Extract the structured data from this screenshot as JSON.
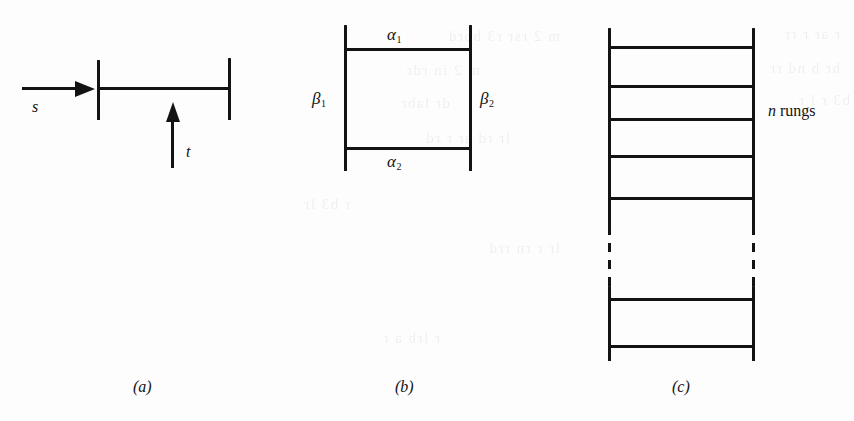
{
  "figure": {
    "background_color": "#fdfdfd",
    "ink_color": "#131313",
    "width": 854,
    "height": 421,
    "panels": [
      {
        "id": "a",
        "caption": "(a)",
        "description": "two vertical bars joined by a horizontal bar, with an incoming horizontal arrow labelled s and an upward arrow labelled t",
        "labels": [
          {
            "name": "s",
            "text": "s",
            "style": "italic"
          },
          {
            "name": "t",
            "text": "t",
            "style": "italic"
          }
        ]
      },
      {
        "id": "b",
        "caption": "(b)",
        "description": "a ladder with two rungs; the rungs are labelled alpha-1 and alpha-2 and the rails are labelled beta-1 and beta-2",
        "labels": [
          {
            "name": "alpha-1",
            "base": "α",
            "sub": "1"
          },
          {
            "name": "alpha-2",
            "base": "α",
            "sub": "2"
          },
          {
            "name": "beta-1",
            "base": "β",
            "sub": "1"
          },
          {
            "name": "beta-2",
            "base": "β",
            "sub": "2"
          }
        ]
      },
      {
        "id": "c",
        "caption": "(c)",
        "description": "a long ladder with n rungs; the middle of the rails is drawn dashed to indicate continuation",
        "labels": [
          {
            "name": "n-rungs",
            "italic_part": "n",
            "roman_part": "rungs"
          }
        ]
      }
    ],
    "captions": {
      "a": "(a)",
      "b": "(b)",
      "c": "(c)"
    },
    "panel_a": {
      "label_s": "s",
      "label_t": "t"
    },
    "panel_b": {
      "alpha1_base": "α",
      "alpha1_sub": "1",
      "alpha2_base": "α",
      "alpha2_sub": "2",
      "beta1_base": "β",
      "beta1_sub": "1",
      "beta2_base": "β",
      "beta2_sub": "2"
    },
    "panel_c": {
      "n_italic": "n",
      "rungs_word": "rungs",
      "rung_count_symbol": "n"
    }
  },
  "ghost_text": {
    "lines": [
      "m 2 rsr  r3 bord",
      "m 2 in  rdr",
      "dr labr",
      "lr rd ar  r  rd",
      "r  b3  lr",
      "r  ar r  rr",
      "hr  b  nd rr",
      "b3  r  l r",
      "lr r  rn  rrd",
      "r lrb  a r"
    ]
  }
}
